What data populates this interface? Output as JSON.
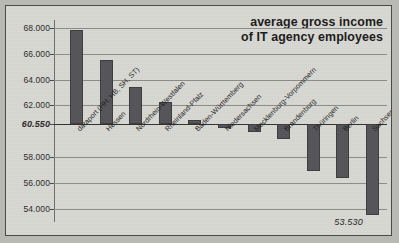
{
  "chart_data": {
    "type": "bar",
    "title": "average gross income of IT agency employees",
    "title_line1": "average gross income",
    "title_line2": "of IT agency employees",
    "xlabel": "",
    "ylabel": "",
    "ylim": [
      53000,
      68600
    ],
    "grid": true,
    "legend": false,
    "baseline": 60550,
    "baseline_label": "60.550",
    "ytick_labels": [
      "68.000",
      "66.000",
      "64.000",
      "62.000",
      "60.550",
      "58.000",
      "56.000",
      "54.000"
    ],
    "ytick_values": [
      68000,
      66000,
      64000,
      62000,
      60550,
      58000,
      56000,
      54000
    ],
    "categories": [
      "dataport (HH, HB, SH, ST)",
      "Hessen",
      "Nordrhein-Westfalen",
      "Rheinland-Pfalz",
      "Baden-Württemberg",
      "Niedersachsen",
      "Mecklenburg-Vorpommern",
      "Brandenburg",
      "Thüringen",
      "Berlin",
      "Sachsen"
    ],
    "values": [
      67800,
      65480,
      63400,
      62250,
      60900,
      60230,
      59980,
      59400,
      56900,
      56400,
      53530
    ],
    "annotations": [
      {
        "text": "53.530",
        "category": "Sachsen",
        "value": 53530
      }
    ]
  }
}
